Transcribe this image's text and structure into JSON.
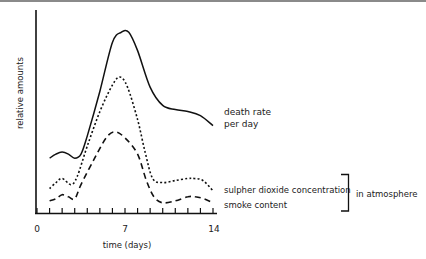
{
  "chart_data": {
    "type": "line",
    "title": "",
    "xlabel": "time (days)",
    "ylabel": "relative amounts",
    "xlim": [
      0,
      14
    ],
    "ylim": [
      0,
      100
    ],
    "x_ticks": [
      0,
      1,
      2,
      3,
      4,
      5,
      6,
      7,
      8,
      9,
      10,
      11,
      12,
      13,
      14
    ],
    "x_tick_labels": [
      {
        "value": 0,
        "label": "0"
      },
      {
        "value": 7,
        "label": "7"
      },
      {
        "value": 14,
        "label": "14"
      }
    ],
    "grid": false,
    "legend_position": "right, inline labels",
    "series": [
      {
        "name": "death rate per day",
        "label_lines": [
          "death rate",
          "per day"
        ],
        "style": "solid",
        "x": [
          1,
          1.5,
          2,
          2.5,
          3,
          3.5,
          4,
          5,
          6,
          6.7,
          7.3,
          8,
          9,
          10,
          11,
          12,
          13,
          14
        ],
        "values": [
          27,
          29,
          30,
          29,
          27,
          29,
          38,
          60,
          84,
          89,
          89,
          80,
          62,
          53,
          51,
          50,
          48,
          43
        ]
      },
      {
        "name": "sulpher dioxide concentration",
        "label_lines": [
          "sulpher dioxide concentration"
        ],
        "style": "dotted",
        "x": [
          1,
          1.5,
          2,
          2.7,
          3.2,
          4,
          5,
          6,
          6.6,
          7.2,
          8,
          8.6,
          9.2,
          10,
          11,
          12,
          12.5,
          13.2,
          14
        ],
        "values": [
          12,
          15,
          17,
          14,
          18,
          33,
          50,
          63,
          67,
          62,
          46,
          30,
          17,
          15,
          16,
          17,
          17,
          16,
          11
        ]
      },
      {
        "name": "smoke content",
        "label_lines": [
          "smoke content"
        ],
        "style": "dashed",
        "x": [
          1,
          1.5,
          2,
          2.5,
          3,
          3.5,
          4.5,
          5.5,
          6.2,
          7,
          8,
          8.7,
          9.3,
          10,
          11,
          12,
          12.6,
          13.3,
          14
        ],
        "values": [
          6,
          7,
          9,
          8,
          7,
          14,
          26,
          37,
          40,
          37,
          29,
          16,
          8,
          5,
          6,
          8,
          8,
          7,
          5
        ]
      }
    ],
    "annotations": [
      {
        "text": "in atmosphere",
        "applies_to": [
          "sulpher dioxide concentration",
          "smoke content"
        ],
        "shape": "right bracket"
      }
    ]
  },
  "labels": {
    "xlabel": "time (days)",
    "ylabel": "relative amounts",
    "tick0": "0",
    "tick7": "7",
    "tick14": "14",
    "death_line1": "death rate",
    "death_line2": "per day",
    "so2": "sulpher dioxide concentration",
    "smoke": "smoke content",
    "bracket": "in atmosphere"
  },
  "colors": {
    "ink": "#111111",
    "text": "#222222",
    "rule": "#8a8a8a",
    "background": "#ffffff"
  }
}
